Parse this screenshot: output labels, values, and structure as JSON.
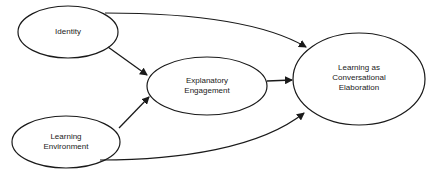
{
  "diagram": {
    "type": "path-model",
    "nodes": [
      {
        "id": "identity",
        "lines": [
          "Identity"
        ]
      },
      {
        "id": "learning_environment",
        "lines": [
          "Learning",
          "Environment"
        ]
      },
      {
        "id": "explanatory_engagement",
        "lines": [
          "Explanatory",
          "Engagement"
        ]
      },
      {
        "id": "learning_conversational",
        "lines": [
          "Learning as",
          "Conversational",
          "Elaboration"
        ]
      }
    ],
    "edges": [
      {
        "from": "identity",
        "to": "explanatory_engagement"
      },
      {
        "from": "learning_environment",
        "to": "explanatory_engagement"
      },
      {
        "from": "explanatory_engagement",
        "to": "learning_conversational"
      },
      {
        "from": "identity",
        "to": "learning_conversational"
      },
      {
        "from": "learning_environment",
        "to": "learning_conversational"
      }
    ],
    "colors": {
      "stroke": "#1a1a1a",
      "background": "#ffffff"
    }
  }
}
